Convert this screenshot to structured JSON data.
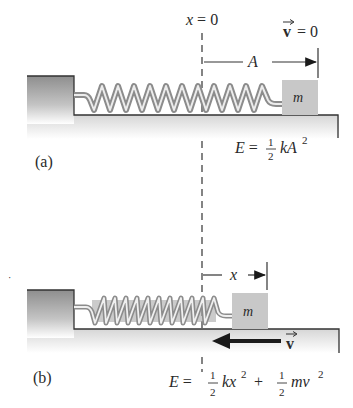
{
  "diagram": {
    "type": "mass-spring-oscillator",
    "origin_label": "x = 0",
    "panels": [
      {
        "id": "a",
        "label": "(a)",
        "mass_label": "m",
        "displacement_label": "A",
        "velocity_label": "v = 0",
        "velocity_vec": "v",
        "velocity_rhs": "= 0",
        "energy_label": "E = ½ kA²",
        "energy": {
          "lhs": "E =",
          "num": "1",
          "den": "2",
          "term": "kA",
          "exp": "2"
        }
      },
      {
        "id": "b",
        "label": "(b)",
        "mass_label": "m",
        "displacement_label": "x",
        "velocity_label": "v",
        "velocity_vec": "v",
        "energy_label": "E = ½ kx² + ½ mv²",
        "energy": {
          "lhs": "E =",
          "num1": "1",
          "den1": "2",
          "term1": "kx",
          "exp1": "2",
          "plus": "+",
          "num2": "1",
          "den2": "2",
          "term2": "mv",
          "exp2": "2"
        }
      }
    ],
    "colors": {
      "wall": "#9a9a9a",
      "mass": "#c8c8c8",
      "spring_outer": "#8c8c8c",
      "spring_inner": "#e8e8e8",
      "line": "#333333",
      "arrow": "#1a1a1a"
    }
  }
}
